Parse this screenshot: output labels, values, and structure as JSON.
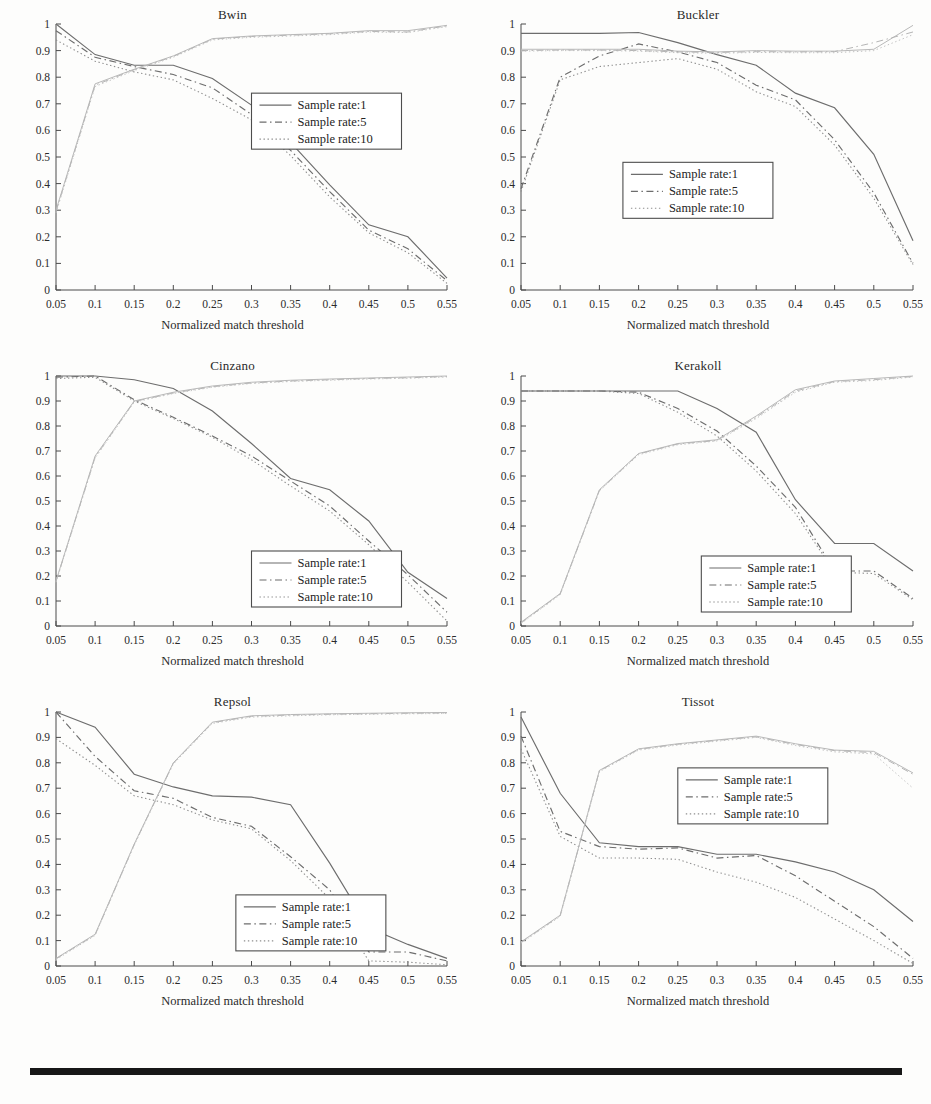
{
  "figure": {
    "layout": "2 columns x 3 rows of line charts",
    "rule_color": "#171717"
  },
  "axis": {
    "xlabel": "Normalized match threshold",
    "ylabel": "",
    "xticks": [
      "0.05",
      "0.1",
      "0.15",
      "0.2",
      "0.25",
      "0.3",
      "0.35",
      "0.4",
      "0.45",
      "0.5",
      "0.55"
    ],
    "yticks": [
      "0",
      "0.1",
      "0.2",
      "0.3",
      "0.4",
      "0.5",
      "0.6",
      "0.7",
      "0.8",
      "0.9",
      "1"
    ],
    "xlim": [
      0.05,
      0.55
    ],
    "ylim": [
      0,
      1
    ]
  },
  "legend": {
    "entries": [
      "Sample rate:1",
      "Sample rate:5",
      "Sample rate:10"
    ],
    "styles": [
      "solid",
      "dash-dot",
      "dotted"
    ]
  },
  "chart_data": [
    {
      "type": "line",
      "title": "Bwin",
      "xlabel": "Normalized match threshold",
      "ylabel": "",
      "xlim": [
        0.05,
        0.55
      ],
      "ylim": [
        0,
        1
      ],
      "grid": false,
      "legend_position": "center-right",
      "x": [
        0.05,
        0.1,
        0.15,
        0.2,
        0.25,
        0.3,
        0.35,
        0.4,
        0.45,
        0.5,
        0.55
      ],
      "series": [
        {
          "name": "Sample rate:1",
          "style": "solid",
          "values": [
            1.0,
            0.885,
            0.845,
            0.845,
            0.795,
            0.695,
            0.555,
            0.395,
            0.245,
            0.2,
            0.045
          ]
        },
        {
          "name": "Sample rate:5",
          "style": "dash-dot",
          "values": [
            0.975,
            0.875,
            0.84,
            0.81,
            0.76,
            0.66,
            0.525,
            0.37,
            0.225,
            0.155,
            0.035
          ]
        },
        {
          "name": "Sample rate:10",
          "style": "dotted",
          "values": [
            0.94,
            0.86,
            0.82,
            0.79,
            0.72,
            0.64,
            0.505,
            0.35,
            0.215,
            0.14,
            0.025
          ]
        },
        {
          "name": "Recall (Sample rate:1)",
          "style": "solid-faint",
          "values": [
            0.3,
            0.775,
            0.83,
            0.88,
            0.945,
            0.955,
            0.96,
            0.965,
            0.975,
            0.975,
            0.995
          ]
        },
        {
          "name": "Recall (Sample rate:5)",
          "style": "dash-dot-faint",
          "values": [
            0.295,
            0.77,
            0.828,
            0.878,
            0.943,
            0.953,
            0.958,
            0.963,
            0.972,
            0.97,
            0.993
          ]
        },
        {
          "name": "Recall (Sample rate:10)",
          "style": "dotted-faint",
          "values": [
            0.29,
            0.765,
            0.825,
            0.875,
            0.94,
            0.95,
            0.955,
            0.96,
            0.97,
            0.968,
            0.99
          ]
        }
      ]
    },
    {
      "type": "line",
      "title": "Buckler",
      "xlabel": "Normalized match threshold",
      "ylabel": "",
      "xlim": [
        0.05,
        0.55
      ],
      "ylim": [
        0,
        1
      ],
      "grid": false,
      "legend_position": "center-left",
      "x": [
        0.05,
        0.1,
        0.15,
        0.2,
        0.25,
        0.3,
        0.35,
        0.4,
        0.45,
        0.5,
        0.55
      ],
      "series": [
        {
          "name": "Sample rate:1",
          "style": "solid",
          "values": [
            0.965,
            0.965,
            0.965,
            0.968,
            0.93,
            0.885,
            0.845,
            0.74,
            0.685,
            0.51,
            0.185
          ]
        },
        {
          "name": "Sample rate:5",
          "style": "dash-dot",
          "values": [
            0.38,
            0.8,
            0.88,
            0.925,
            0.895,
            0.855,
            0.77,
            0.715,
            0.565,
            0.365,
            0.1
          ]
        },
        {
          "name": "Sample rate:10",
          "style": "dotted",
          "values": [
            0.37,
            0.79,
            0.84,
            0.855,
            0.87,
            0.83,
            0.745,
            0.69,
            0.545,
            0.345,
            0.095
          ]
        },
        {
          "name": "Recall (Sample rate:1)",
          "style": "solid-faint",
          "values": [
            0.905,
            0.905,
            0.905,
            0.905,
            0.898,
            0.895,
            0.9,
            0.898,
            0.898,
            0.905,
            0.995
          ]
        },
        {
          "name": "Recall (Sample rate:5)",
          "style": "dash-dot-faint",
          "values": [
            0.9,
            0.902,
            0.902,
            0.9,
            0.895,
            0.893,
            0.896,
            0.895,
            0.896,
            0.93,
            0.97
          ]
        },
        {
          "name": "Recall (Sample rate:10)",
          "style": "dotted-faint",
          "values": [
            0.898,
            0.9,
            0.9,
            0.898,
            0.892,
            0.89,
            0.893,
            0.892,
            0.892,
            0.9,
            0.96
          ]
        }
      ]
    },
    {
      "type": "line",
      "title": "Cinzano",
      "xlabel": "Normalized match threshold",
      "ylabel": "",
      "xlim": [
        0.05,
        0.55
      ],
      "ylim": [
        0,
        1
      ],
      "grid": false,
      "legend_position": "bottom-right",
      "x": [
        0.05,
        0.1,
        0.15,
        0.2,
        0.25,
        0.3,
        0.35,
        0.4,
        0.45,
        0.5,
        0.55
      ],
      "series": [
        {
          "name": "Sample rate:1",
          "style": "solid",
          "values": [
            1.0,
            1.0,
            0.985,
            0.95,
            0.86,
            0.73,
            0.59,
            0.545,
            0.42,
            0.215,
            0.11
          ]
        },
        {
          "name": "Sample rate:5",
          "style": "dash-dot",
          "values": [
            0.995,
            1.0,
            0.905,
            0.835,
            0.76,
            0.68,
            0.58,
            0.48,
            0.34,
            0.205,
            0.055
          ]
        },
        {
          "name": "Sample rate:10",
          "style": "dotted",
          "values": [
            0.99,
            0.995,
            0.9,
            0.83,
            0.755,
            0.665,
            0.56,
            0.46,
            0.325,
            0.175,
            0.02
          ]
        },
        {
          "name": "Recall (Sample rate:1)",
          "style": "solid-faint",
          "values": [
            0.18,
            0.68,
            0.9,
            0.935,
            0.96,
            0.975,
            0.983,
            0.988,
            0.992,
            0.996,
            1.0
          ]
        },
        {
          "name": "Recall (Sample rate:5)",
          "style": "dash-dot-faint",
          "values": [
            0.178,
            0.675,
            0.898,
            0.932,
            0.957,
            0.972,
            0.98,
            0.985,
            0.99,
            0.993,
            0.998
          ]
        },
        {
          "name": "Recall (Sample rate:10)",
          "style": "dotted-faint",
          "values": [
            0.175,
            0.672,
            0.895,
            0.93,
            0.955,
            0.97,
            0.978,
            0.983,
            0.988,
            0.991,
            0.996
          ]
        }
      ]
    },
    {
      "type": "line",
      "title": "Kerakoll",
      "xlabel": "Normalized match threshold",
      "ylabel": "",
      "xlim": [
        0.05,
        0.55
      ],
      "ylim": [
        0,
        1
      ],
      "grid": false,
      "legend_position": "bottom-center",
      "x": [
        0.05,
        0.1,
        0.15,
        0.2,
        0.25,
        0.3,
        0.35,
        0.4,
        0.45,
        0.5,
        0.55
      ],
      "series": [
        {
          "name": "Sample rate:1",
          "style": "solid",
          "values": [
            0.94,
            0.94,
            0.94,
            0.94,
            0.94,
            0.87,
            0.775,
            0.505,
            0.33,
            0.33,
            0.22
          ]
        },
        {
          "name": "Sample rate:5",
          "style": "dash-dot",
          "values": [
            0.94,
            0.94,
            0.94,
            0.935,
            0.87,
            0.78,
            0.64,
            0.475,
            0.22,
            0.22,
            0.11
          ]
        },
        {
          "name": "Sample rate:10",
          "style": "dotted",
          "values": [
            0.94,
            0.94,
            0.94,
            0.93,
            0.855,
            0.76,
            0.62,
            0.45,
            0.215,
            0.21,
            0.105
          ]
        },
        {
          "name": "Recall (Sample rate:1)",
          "style": "solid-faint",
          "values": [
            0.015,
            0.13,
            0.545,
            0.69,
            0.73,
            0.745,
            0.84,
            0.945,
            0.98,
            0.99,
            1.0
          ]
        },
        {
          "name": "Recall (Sample rate:5)",
          "style": "dash-dot-faint",
          "values": [
            0.012,
            0.128,
            0.542,
            0.688,
            0.728,
            0.742,
            0.835,
            0.94,
            0.978,
            0.985,
            0.998
          ]
        },
        {
          "name": "Recall (Sample rate:10)",
          "style": "dotted-faint",
          "values": [
            0.01,
            0.125,
            0.54,
            0.685,
            0.725,
            0.74,
            0.83,
            0.935,
            0.975,
            0.982,
            0.996
          ]
        }
      ]
    },
    {
      "type": "line",
      "title": "Repsol",
      "xlabel": "Normalized match threshold",
      "ylabel": "",
      "xlim": [
        0.05,
        0.55
      ],
      "ylim": [
        0,
        1
      ],
      "grid": false,
      "legend_position": "bottom-center",
      "x": [
        0.05,
        0.1,
        0.15,
        0.2,
        0.25,
        0.3,
        0.35,
        0.4,
        0.45,
        0.5,
        0.55
      ],
      "series": [
        {
          "name": "Sample rate:1",
          "style": "solid",
          "values": [
            1.0,
            0.94,
            0.755,
            0.705,
            0.67,
            0.665,
            0.635,
            0.405,
            0.15,
            0.085,
            0.03
          ]
        },
        {
          "name": "Sample rate:5",
          "style": "dash-dot",
          "values": [
            1.0,
            0.825,
            0.69,
            0.66,
            0.585,
            0.55,
            0.43,
            0.3,
            0.055,
            0.055,
            0.02
          ]
        },
        {
          "name": "Sample rate:10",
          "style": "dotted",
          "values": [
            0.895,
            0.79,
            0.67,
            0.635,
            0.575,
            0.54,
            0.415,
            0.265,
            0.02,
            0.015,
            0.005
          ]
        },
        {
          "name": "Recall (Sample rate:1)",
          "style": "solid-faint",
          "values": [
            0.03,
            0.125,
            0.48,
            0.8,
            0.96,
            0.985,
            0.99,
            0.993,
            0.995,
            0.997,
            0.998
          ]
        },
        {
          "name": "Recall (Sample rate:5)",
          "style": "dash-dot-faint",
          "values": [
            0.028,
            0.122,
            0.478,
            0.798,
            0.958,
            0.983,
            0.988,
            0.991,
            0.993,
            0.995,
            0.996
          ]
        },
        {
          "name": "Recall (Sample rate:10)",
          "style": "dotted-faint",
          "values": [
            0.025,
            0.12,
            0.475,
            0.795,
            0.955,
            0.98,
            0.985,
            0.989,
            0.991,
            0.993,
            0.994
          ]
        }
      ]
    },
    {
      "type": "line",
      "title": "Tissot",
      "xlabel": "Normalized match threshold",
      "ylabel": "",
      "xlim": [
        0.05,
        0.55
      ],
      "ylim": [
        0,
        1
      ],
      "grid": false,
      "legend_position": "top-center",
      "x": [
        0.05,
        0.1,
        0.15,
        0.2,
        0.25,
        0.3,
        0.35,
        0.4,
        0.45,
        0.5,
        0.55
      ],
      "series": [
        {
          "name": "Sample rate:1",
          "style": "solid",
          "values": [
            0.98,
            0.68,
            0.485,
            0.47,
            0.47,
            0.44,
            0.44,
            0.41,
            0.37,
            0.3,
            0.175
          ]
        },
        {
          "name": "Sample rate:5",
          "style": "dash-dot",
          "values": [
            0.905,
            0.53,
            0.47,
            0.46,
            0.465,
            0.425,
            0.435,
            0.355,
            0.255,
            0.155,
            0.03
          ]
        },
        {
          "name": "Sample rate:10",
          "style": "dotted",
          "values": [
            0.855,
            0.51,
            0.425,
            0.425,
            0.42,
            0.37,
            0.33,
            0.27,
            0.185,
            0.1,
            0.01
          ]
        },
        {
          "name": "Recall (Sample rate:1)",
          "style": "solid-faint",
          "values": [
            0.095,
            0.2,
            0.77,
            0.855,
            0.875,
            0.89,
            0.905,
            0.875,
            0.85,
            0.845,
            0.76
          ]
        },
        {
          "name": "Recall (Sample rate:5)",
          "style": "dash-dot-faint",
          "values": [
            0.092,
            0.198,
            0.768,
            0.853,
            0.873,
            0.888,
            0.902,
            0.872,
            0.848,
            0.84,
            0.755
          ]
        },
        {
          "name": "Recall (Sample rate:10)",
          "style": "dotted-faint",
          "values": [
            0.09,
            0.195,
            0.765,
            0.85,
            0.87,
            0.885,
            0.9,
            0.868,
            0.843,
            0.835,
            0.7
          ]
        }
      ]
    }
  ]
}
